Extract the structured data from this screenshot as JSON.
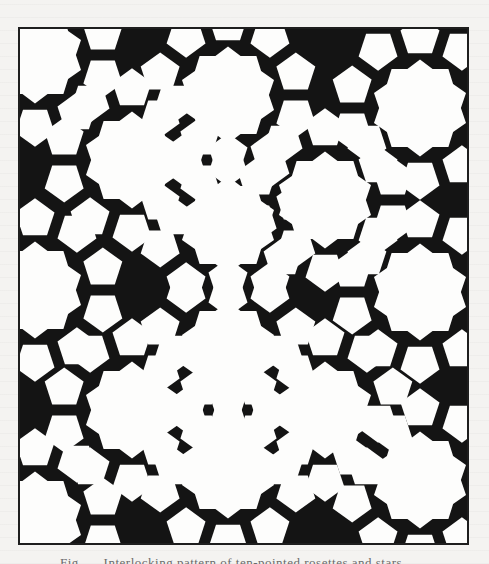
{
  "page": {
    "background": "#f4f3f1",
    "ink": "#141414"
  },
  "figure": {
    "type": "decagonal geometric tiling (10-fold rosettes)",
    "frame": {
      "x": 18,
      "y": 27,
      "width": 451,
      "height": 518,
      "border_color": "#1e1e1e"
    },
    "fill_dark": "#141414",
    "fill_light": "#fdfdfc",
    "rosette_radius": 62,
    "rosette_centers": [
      [
        228,
        95
      ],
      [
        228,
        225
      ],
      [
        228,
        350
      ],
      [
        228,
        470
      ],
      [
        420,
        108
      ],
      [
        420,
        292
      ],
      [
        420,
        480
      ],
      [
        35,
        55
      ],
      [
        35,
        290
      ],
      [
        35,
        520
      ],
      [
        132,
        160
      ],
      [
        132,
        410
      ],
      [
        325,
        200
      ],
      [
        325,
        410
      ]
    ]
  },
  "caption": {
    "text": "Fig. — Interlocking pattern of ten-pointed rosettes and stars",
    "legible": false
  }
}
